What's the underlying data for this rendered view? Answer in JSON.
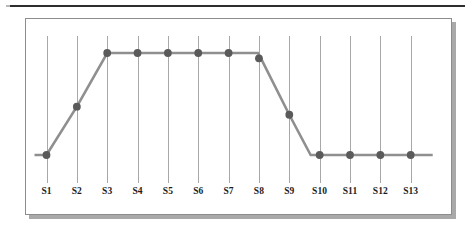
{
  "figure": {
    "frame_border_color": "#8d8d8d",
    "frame_background": "#ffffff",
    "shadow_color": "#a9a9a9",
    "top_rule_color": "#2e2e2e"
  },
  "chart_data": {
    "type": "line",
    "title": "",
    "subtitle": "",
    "xlabel": "",
    "ylabel": "",
    "grid": "vertical-gridlines-only",
    "legend": "none",
    "axis_visible": false,
    "ytick_labels": [],
    "ylim": [
      0,
      1
    ],
    "line_color": "#8f8f8f",
    "marker_color": "#5a5a5a",
    "gridline_color": "#a8a8a8",
    "marker_shape": "circle",
    "categories": [
      "S1",
      "S2",
      "S3",
      "S4",
      "S5",
      "S6",
      "S7",
      "S8",
      "S9",
      "S10",
      "S11",
      "S12",
      "S13"
    ],
    "series": [
      {
        "name": "Series 1",
        "values": [
          0.22,
          0.58,
          0.98,
          0.98,
          0.98,
          0.98,
          0.98,
          0.94,
          0.52,
          0.22,
          0.22,
          0.22,
          0.22
        ]
      }
    ]
  },
  "xaxis": {
    "ticks": [
      {
        "label": "S1"
      },
      {
        "label": "S2"
      },
      {
        "label": "S3"
      },
      {
        "label": "S4"
      },
      {
        "label": "S5"
      },
      {
        "label": "S6"
      },
      {
        "label": "S7"
      },
      {
        "label": "S8"
      },
      {
        "label": "S9"
      },
      {
        "label": "S10"
      },
      {
        "label": "S11"
      },
      {
        "label": "S12"
      },
      {
        "label": "S13"
      }
    ]
  }
}
